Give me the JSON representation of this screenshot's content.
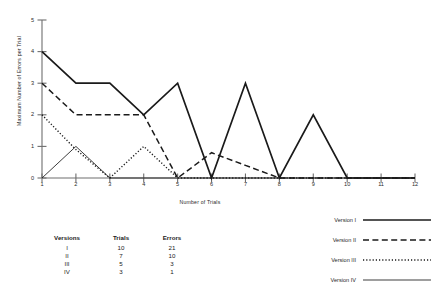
{
  "chart_data": {
    "type": "line",
    "title": "",
    "xlabel": "Number of Trials",
    "ylabel": "Maximum Number of Errors per Trial",
    "x": [
      1,
      2,
      3,
      4,
      5,
      6,
      7,
      8,
      9,
      10,
      11,
      12
    ],
    "xticks": [
      "1",
      "2",
      "3",
      "4",
      "5",
      "6",
      "7",
      "8",
      "9",
      "10",
      "11",
      "12"
    ],
    "yticks": [
      "0",
      "1",
      "2",
      "3",
      "4",
      "5"
    ],
    "xlim": [
      1,
      12
    ],
    "ylim": [
      0,
      5
    ],
    "grid": false,
    "legend_position": "bottom-right",
    "series": [
      {
        "name": "Version I",
        "style": "solid-thick",
        "values": [
          4,
          3,
          3,
          2,
          3,
          0,
          3,
          0,
          2,
          0,
          0,
          0
        ]
      },
      {
        "name": "Version II",
        "style": "dashed",
        "values": [
          3,
          2,
          2,
          2,
          0,
          0.8,
          0.4,
          0,
          0,
          0,
          0,
          0
        ]
      },
      {
        "name": "Version III",
        "style": "dotted",
        "values": [
          2,
          0.9,
          0,
          1,
          0,
          0,
          0,
          0,
          0,
          0,
          0,
          0
        ]
      },
      {
        "name": "Version IV",
        "style": "solid-thin",
        "values": [
          0,
          1,
          0,
          0,
          0,
          0,
          0,
          0,
          0,
          0,
          0,
          0
        ]
      }
    ]
  },
  "legend": {
    "items": [
      {
        "label": "Version I",
        "style": "solid-thick"
      },
      {
        "label": "Version II",
        "style": "dashed"
      },
      {
        "label": "Version III",
        "style": "dotted"
      },
      {
        "label": "Version IV",
        "style": "solid-thin"
      }
    ]
  },
  "table": {
    "headers": [
      "Versions",
      "Trials",
      "Errors"
    ],
    "rows": [
      [
        "I",
        "10",
        "21"
      ],
      [
        "II",
        "7",
        "10"
      ],
      [
        "III",
        "5",
        "3"
      ],
      [
        "IV",
        "3",
        "1"
      ]
    ]
  },
  "colors": {
    "line": "#1a1a1a",
    "axis": "#6e6e6e",
    "text": "#1f1f1f",
    "background": "#ffffff"
  }
}
